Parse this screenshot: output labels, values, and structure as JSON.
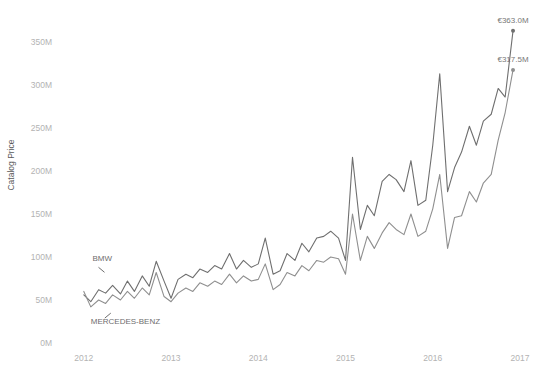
{
  "chart_data": {
    "type": "line",
    "title": "",
    "xlabel": "",
    "ylabel": "Catalog Price",
    "ylim": [
      0,
      380
    ],
    "xlim": [
      2011.75,
      2017.0
    ],
    "grid": false,
    "legend_position": "inline-annotation",
    "y_ticks": [
      0,
      50,
      100,
      150,
      200,
      250,
      300,
      350
    ],
    "y_tick_labels": [
      "0M",
      "50M",
      "100M",
      "150M",
      "200M",
      "250M",
      "300M",
      "350M"
    ],
    "x_ticks": [
      2012,
      2013,
      2014,
      2015,
      2016,
      2017
    ],
    "x_tick_labels": [
      "2012",
      "2013",
      "2014",
      "2015",
      "2016",
      "2017"
    ],
    "value_unit": "M",
    "currency_symbol": "€",
    "series": [
      {
        "name": "BMW",
        "color": "#6f6f6f",
        "end_label": "€363.0M",
        "end_value": 363.0,
        "x": [
          2012.0,
          2012.08,
          2012.17,
          2012.25,
          2012.33,
          2012.42,
          2012.5,
          2012.58,
          2012.67,
          2012.75,
          2012.83,
          2012.92,
          2013.0,
          2013.08,
          2013.17,
          2013.25,
          2013.33,
          2013.42,
          2013.5,
          2013.58,
          2013.67,
          2013.75,
          2013.83,
          2013.92,
          2014.0,
          2014.08,
          2014.17,
          2014.25,
          2014.33,
          2014.42,
          2014.5,
          2014.58,
          2014.67,
          2014.75,
          2014.83,
          2014.92,
          2015.0,
          2015.08,
          2015.17,
          2015.25,
          2015.33,
          2015.42,
          2015.5,
          2015.58,
          2015.67,
          2015.75,
          2015.83,
          2015.92,
          2016.0,
          2016.08,
          2016.17,
          2016.25,
          2016.33,
          2016.42,
          2016.5,
          2016.58,
          2016.67,
          2016.75,
          2016.83,
          2016.92
        ],
        "y": [
          56,
          48,
          62,
          58,
          67,
          57,
          72,
          60,
          78,
          66,
          95,
          72,
          52,
          74,
          80,
          76,
          86,
          82,
          90,
          86,
          104,
          86,
          96,
          88,
          92,
          122,
          80,
          84,
          104,
          96,
          116,
          106,
          122,
          124,
          130,
          122,
          96,
          216,
          132,
          160,
          148,
          188,
          196,
          190,
          176,
          212,
          160,
          166,
          230,
          313,
          176,
          204,
          222,
          252,
          230,
          258,
          266,
          296,
          286,
          363
        ]
      },
      {
        "name": "MERCEDES-BENZ",
        "color": "#8f8f8f",
        "end_label": "€317.5M",
        "end_value": 317.5,
        "x": [
          2012.0,
          2012.08,
          2012.17,
          2012.25,
          2012.33,
          2012.42,
          2012.5,
          2012.58,
          2012.67,
          2012.75,
          2012.83,
          2012.92,
          2013.0,
          2013.08,
          2013.17,
          2013.25,
          2013.33,
          2013.42,
          2013.5,
          2013.58,
          2013.67,
          2013.75,
          2013.83,
          2013.92,
          2014.0,
          2014.08,
          2014.17,
          2014.25,
          2014.33,
          2014.42,
          2014.5,
          2014.58,
          2014.67,
          2014.75,
          2014.83,
          2014.92,
          2015.0,
          2015.08,
          2015.17,
          2015.25,
          2015.33,
          2015.42,
          2015.5,
          2015.58,
          2015.67,
          2015.75,
          2015.83,
          2015.92,
          2016.0,
          2016.08,
          2016.17,
          2016.25,
          2016.33,
          2016.42,
          2016.5,
          2016.58,
          2016.67,
          2016.75,
          2016.83,
          2016.92
        ],
        "y": [
          60,
          42,
          50,
          46,
          56,
          50,
          60,
          52,
          64,
          56,
          82,
          54,
          48,
          58,
          64,
          60,
          70,
          66,
          72,
          68,
          80,
          70,
          78,
          72,
          74,
          92,
          62,
          68,
          82,
          78,
          90,
          84,
          96,
          94,
          100,
          98,
          80,
          150,
          96,
          124,
          110,
          128,
          140,
          132,
          126,
          150,
          124,
          130,
          156,
          196,
          110,
          146,
          148,
          176,
          164,
          186,
          196,
          236,
          268,
          317.5
        ]
      }
    ],
    "annotations": [
      {
        "text": "BMW",
        "series": "BMW",
        "x": 2012.1,
        "y": 95
      },
      {
        "text": "MERCEDES-BENZ",
        "series": "MERCEDES-BENZ",
        "x": 2012.08,
        "y": 22
      }
    ]
  }
}
